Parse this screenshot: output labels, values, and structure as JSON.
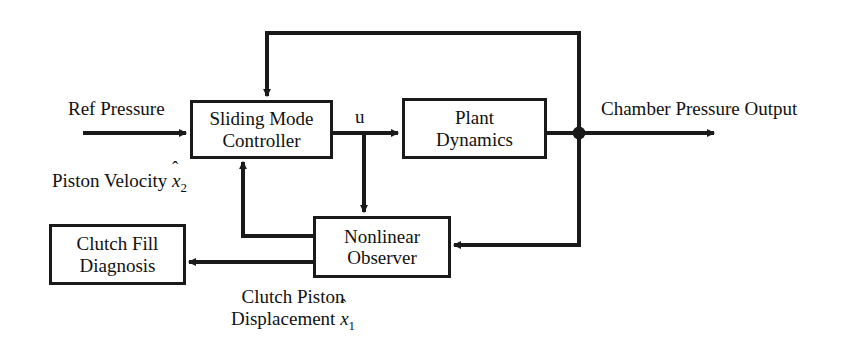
{
  "diagram": {
    "background_color": "#ffffff",
    "line_color": "#1a1a1a",
    "text_color": "#111111",
    "blocks": [
      {
        "id": "sliding-mode-controller",
        "line1": "Sliding Mode",
        "line2": "Controller"
      },
      {
        "id": "plant-dynamics",
        "line1": "Plant",
        "line2": "Dynamics"
      },
      {
        "id": "nonlinear-observer",
        "line1": "Nonlinear",
        "line2": "Observer"
      },
      {
        "id": "clutch-fill-diagnosis",
        "line1": "Clutch Fill",
        "line2": "Diagnosis"
      }
    ],
    "labels": {
      "ref_pressure": "Ref Pressure",
      "control_signal": "u",
      "chamber_pressure_output": "Chamber Pressure Output",
      "piston_velocity_text": "Piston Velocity",
      "piston_velocity_symbol": "x",
      "piston_velocity_hat": "ˆ",
      "piston_velocity_subscript": "2",
      "clutch_piston_line1": "Clutch Piston",
      "clutch_piston_line2": "Displacement",
      "clutch_piston_symbol": "x",
      "clutch_piston_hat": "ˆ",
      "clutch_piston_subscript": "1"
    }
  }
}
